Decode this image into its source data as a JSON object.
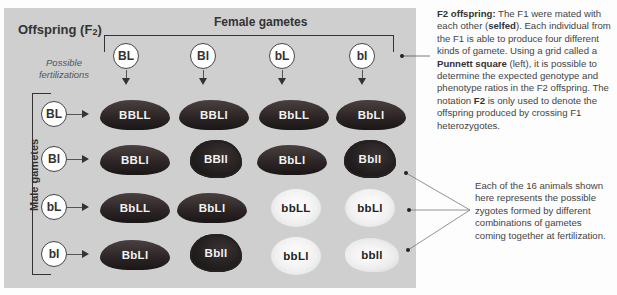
{
  "title": {
    "main": "Offspring (F",
    "sub": "2",
    "close": ")"
  },
  "female_label": "Female gametes",
  "male_label": "Male gametes",
  "possible_label": "Possible fertilizations",
  "female_gametes": [
    "BL",
    "Bl",
    "bL",
    "bl"
  ],
  "male_gametes": [
    "BL",
    "Bl",
    "bL",
    "bl"
  ],
  "grid": [
    [
      {
        "genotype": "BBLL",
        "type": "smooth"
      },
      {
        "genotype": "BBLl",
        "type": "smooth"
      },
      {
        "genotype": "BbLL",
        "type": "smooth"
      },
      {
        "genotype": "BbLl",
        "type": "smooth"
      }
    ],
    [
      {
        "genotype": "BBLl",
        "type": "smooth"
      },
      {
        "genotype": "BBll",
        "type": "rough"
      },
      {
        "genotype": "BbLl",
        "type": "smooth"
      },
      {
        "genotype": "Bbll",
        "type": "rough"
      }
    ],
    [
      {
        "genotype": "BbLL",
        "type": "smooth"
      },
      {
        "genotype": "BbLl",
        "type": "smooth"
      },
      {
        "genotype": "bbLL",
        "type": "white"
      },
      {
        "genotype": "bbLl",
        "type": "white"
      }
    ],
    [
      {
        "genotype": "BbLl",
        "type": "smooth"
      },
      {
        "genotype": "Bbll",
        "type": "rough"
      },
      {
        "genotype": "bbLl",
        "type": "white"
      },
      {
        "genotype": "bbll",
        "type": "white-rough"
      }
    ]
  ],
  "description_1": {
    "lead": "F2 offspring:",
    "part1": " The F1 were mated with each other (",
    "selfed": "selfed",
    "part2": ").  Each individual from the F1 is able to produce four different kinds of gamete.  Using a grid called a ",
    "punnett": "Punnett square",
    "part3": " (left), it is possible to determine the expected genotype and phenotype ratios in the F2 offspring. The notation ",
    "f2": "F2",
    "part4": " is only used to denote the offspring produced by crossing F1 heterozygotes."
  },
  "description_2": "Each of the 16 animals shown here represents the possible zygotes formed by different combinations of gametes coming together at fertilization.",
  "colors": {
    "panel": "#cfcfcf",
    "background": "#fdfdfd",
    "text": "#444444"
  }
}
